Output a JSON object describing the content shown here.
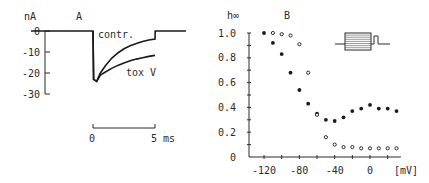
{
  "chart_data": [
    {
      "panel": "A",
      "type": "line",
      "title": "A",
      "ylabel": "nA",
      "xlabel": "ms",
      "ylim": [
        -30,
        0
      ],
      "yticks": [
        "0",
        "-10",
        "-20",
        "-30"
      ],
      "ytick_values": [
        0,
        -10,
        -20,
        -30
      ],
      "time_scale_bar": {
        "labels": [
          "0",
          "5 ms"
        ],
        "values": [
          0,
          5
        ]
      },
      "xlim": [
        -5,
        7.5
      ],
      "series": [
        {
          "name": "contr.",
          "label": "contr.",
          "x": [
            -5,
            0,
            0.05,
            0.3,
            0.6,
            1,
            1.5,
            2,
            2.5,
            3,
            3.5,
            4,
            4.5,
            5,
            5.02,
            7.5
          ],
          "y": [
            0,
            0,
            -23,
            -24,
            -20,
            -16.5,
            -13,
            -10.5,
            -8.5,
            -7,
            -6,
            -5,
            -4.3,
            -3.8,
            0,
            0
          ]
        },
        {
          "name": "tox V",
          "label": "tox V",
          "x": [
            0,
            0.05,
            0.3,
            0.6,
            1,
            1.5,
            2,
            2.5,
            3,
            3.5,
            4,
            4.5,
            5
          ],
          "y": [
            0,
            -23,
            -24,
            -21,
            -19.5,
            -17.8,
            -16.4,
            -15.2,
            -14.2,
            -13.4,
            -12.7,
            -12.1,
            -11.6
          ]
        }
      ]
    },
    {
      "panel": "B",
      "type": "scatter",
      "title": "B",
      "ylabel": "h∞",
      "xlabel": "[mV]",
      "xlim": [
        -135,
        40
      ],
      "ylim": [
        0,
        1.0
      ],
      "xticks": [
        "-120",
        "-80",
        "-40",
        "0"
      ],
      "xtick_values": [
        -120,
        -80,
        -40,
        0
      ],
      "yticks": [
        "0",
        "0.2",
        "0.4",
        "0.6",
        "0.8",
        "1.0"
      ],
      "ytick_values": [
        0,
        0.2,
        0.4,
        0.6,
        0.8,
        1.0
      ],
      "inset": "pulse-protocol",
      "series": [
        {
          "name": "filled",
          "marker": "filled-circle",
          "x": [
            -120,
            -110,
            -100,
            -90,
            -80,
            -70,
            -60,
            -50,
            -40,
            -30,
            -20,
            -10,
            0,
            10,
            20,
            30
          ],
          "y": [
            1.0,
            0.92,
            0.83,
            0.68,
            0.54,
            0.43,
            0.35,
            0.3,
            0.29,
            0.32,
            0.37,
            0.39,
            0.42,
            0.39,
            0.39,
            0.37
          ]
        },
        {
          "name": "open",
          "marker": "open-circle",
          "x": [
            -110,
            -100,
            -90,
            -80,
            -70,
            -60,
            -50,
            -40,
            -30,
            -20,
            -10,
            0,
            10,
            20,
            30
          ],
          "y": [
            1.0,
            0.99,
            0.98,
            0.91,
            0.68,
            0.34,
            0.16,
            0.1,
            0.08,
            0.08,
            0.07,
            0.07,
            0.07,
            0.07,
            0.07
          ]
        }
      ]
    }
  ]
}
